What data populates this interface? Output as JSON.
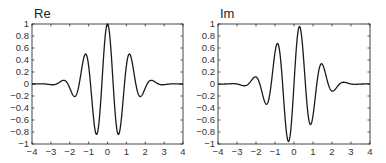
{
  "chart_data": [
    {
      "type": "line",
      "title": "Re",
      "xlabel": "",
      "ylabel": "",
      "xlim": [
        -4,
        4
      ],
      "ylim": [
        -1,
        1
      ],
      "grid": false,
      "x_ticks": [
        "−4",
        "−3",
        "−2",
        "−1",
        "0",
        "1",
        "2",
        "3",
        "4"
      ],
      "y_ticks": [
        "1",
        "0.8",
        "0.6",
        "0.4",
        "0.2",
        "0",
        "−0.2",
        "−0.4",
        "−0.6",
        "−0.8",
        "−1"
      ],
      "function": "cos(5.236x)·exp(−x²/2)",
      "key_points": [
        {
          "x": -2.4,
          "y": 0.05
        },
        {
          "x": -1.8,
          "y": -0.18
        },
        {
          "x": -1.2,
          "y": 0.47
        },
        {
          "x": -0.6,
          "y": -0.83
        },
        {
          "x": 0,
          "y": 1.0
        },
        {
          "x": 0.6,
          "y": -0.83
        },
        {
          "x": 1.2,
          "y": 0.47
        },
        {
          "x": 1.8,
          "y": -0.18
        },
        {
          "x": 2.4,
          "y": 0.05
        }
      ],
      "omega": 5.236,
      "phase": "cos"
    },
    {
      "type": "line",
      "title": "Im",
      "xlabel": "",
      "ylabel": "",
      "xlim": [
        -4,
        4
      ],
      "ylim": [
        -1,
        1
      ],
      "grid": false,
      "x_ticks": [
        "−4",
        "−3",
        "−2",
        "−1",
        "0",
        "1",
        "2",
        "3",
        "4"
      ],
      "y_ticks": [
        "1",
        "0.8",
        "0.6",
        "0.4",
        "0.2",
        "0",
        "−0.2",
        "−0.4",
        "−0.6",
        "−0.8",
        "−1"
      ],
      "function": "sin(5.236x)·exp(−x²/2)",
      "key_points": [
        {
          "x": -2.1,
          "y": 0.11
        },
        {
          "x": -1.5,
          "y": -0.32
        },
        {
          "x": -0.9,
          "y": 0.67
        },
        {
          "x": -0.3,
          "y": -0.96
        },
        {
          "x": 0.3,
          "y": 0.96
        },
        {
          "x": 0.9,
          "y": -0.67
        },
        {
          "x": 1.5,
          "y": 0.32
        },
        {
          "x": 2.1,
          "y": -0.11
        }
      ],
      "omega": 5.236,
      "phase": "sin"
    }
  ],
  "panels": [
    {
      "title": "Re",
      "box": {
        "x0": 32,
        "y0": 24,
        "x1": 183,
        "y1": 144
      }
    },
    {
      "title": "Im",
      "box": {
        "x0": 218,
        "y0": 24,
        "x1": 370,
        "y1": 144
      }
    }
  ],
  "colors": {
    "line": "#1a1a1a",
    "axis": "#333333"
  }
}
